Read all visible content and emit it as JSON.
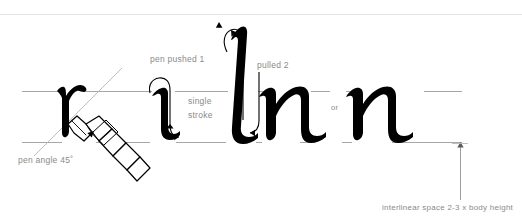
{
  "diagram": {
    "colors": {
      "ink": "#000000",
      "label_text": "#8a8a8a",
      "guideline": "#9a9a9a",
      "top_rule": "#e2e2e2",
      "background": "#ffffff"
    },
    "labels": {
      "pen_pushed": "pen pushed 1",
      "pulled": "pulled  2",
      "single": "single",
      "stroke": "stroke",
      "or": "or",
      "pen_angle": "pen angle 45˚",
      "interlinear": "interlinear space 2-3 x body height"
    },
    "letters": [
      {
        "glyph": "r",
        "note": "partial stroke under pen nib"
      },
      {
        "glyph": "i",
        "note": "single stroke with push-pull arrows"
      },
      {
        "glyph": "l",
        "note": "ascender, pushed 1 / pulled 2"
      },
      {
        "glyph": "n",
        "note": "first n"
      },
      {
        "glyph": "n",
        "note": "second n after 'or'"
      }
    ],
    "guidelines": {
      "x_height_top_y": 91,
      "baseline_y": 142,
      "body_height": 51,
      "pen_angle_degrees": 45
    },
    "annotations": {
      "interlinear_arrow": "vertical double-ended measure from baseline downward",
      "pen_angle_guide": "diagonal 45 degree line through nib"
    }
  }
}
